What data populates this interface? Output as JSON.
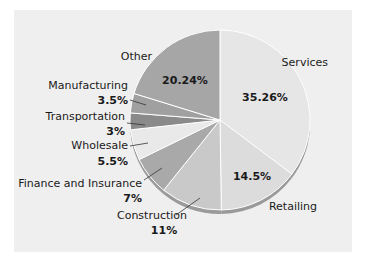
{
  "chart_data": {
    "type": "pie",
    "title": "",
    "start_angle_deg": 0,
    "direction": "clockwise",
    "slices": [
      {
        "label": "Services",
        "value": 35.26,
        "display": "35.26%",
        "color": "#e6e6e6"
      },
      {
        "label": "Retailing",
        "value": 14.5,
        "display": "14.5%",
        "color": "#dcdcdc"
      },
      {
        "label": "Construction",
        "value": 11,
        "display": "11%",
        "color": "#c9c9c9"
      },
      {
        "label": "Finance and Insurance",
        "value": 7,
        "display": "7%",
        "color": "#a9a9a9"
      },
      {
        "label": "Wholesale",
        "value": 5.5,
        "display": "5.5%",
        "color": "#e9e9e9"
      },
      {
        "label": "Transportation",
        "value": 3,
        "display": "3%",
        "color": "#8a8a8a"
      },
      {
        "label": "Manufacturing",
        "value": 3.5,
        "display": "3.5%",
        "color": "#a0a0a0"
      },
      {
        "label": "Other",
        "value": 20.24,
        "display": "20.24%",
        "color": "#a6a6a6"
      }
    ],
    "legend": "none (direct labels)"
  },
  "colors": {
    "panel_background": "#efefef",
    "page_background": "#ffffff",
    "edge_shadow": "#9a9a9a",
    "separator": "#ffffff"
  }
}
